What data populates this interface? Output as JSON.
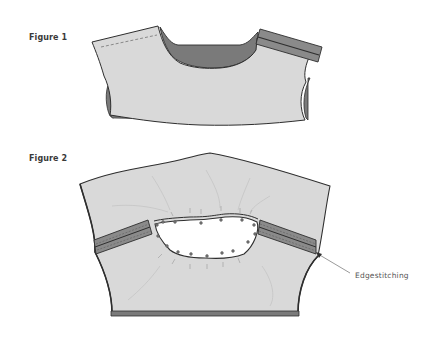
{
  "figures": [
    {
      "label": "Figure 1",
      "description": "Front bodice piece with shoulder seam folded; neckline facing shown in darker gray"
    },
    {
      "label": "Figure 2",
      "description": "Bodice with neckline opening pinned, shoulder seams pressed and edgestitched"
    }
  ],
  "callouts": [
    {
      "label": "Edgestitching",
      "target": "right-shoulder-seam"
    }
  ],
  "colors": {
    "fabric": "#d9d9d9",
    "fabric_dark": "#7a7a7a",
    "outline": "#2e2e2e",
    "background": "#ffffff",
    "text": "#3a3a3a"
  }
}
